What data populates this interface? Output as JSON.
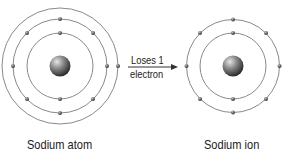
{
  "diagram": {
    "atom": {
      "label": "Sodium atom",
      "nucleus": {
        "cx": 60,
        "cy": 66,
        "r": 10.5
      },
      "shells": [
        {
          "r": 33,
          "electrons": 2
        },
        {
          "r": 47,
          "electrons": 8
        },
        {
          "r": 58,
          "electrons": 1
        }
      ]
    },
    "ion": {
      "label": "Sodium ion",
      "nucleus": {
        "cx": 233,
        "cy": 66,
        "r": 10.5
      },
      "shells": [
        {
          "r": 33,
          "electrons": 2
        },
        {
          "r": 46.5,
          "electrons": 8
        }
      ]
    },
    "arrow": {
      "top_text": "Loses 1",
      "bottom_text": "electron"
    },
    "colors": {
      "shell": "#8a8a8a",
      "electron": "#555555",
      "text": "#1a1a1a"
    }
  }
}
